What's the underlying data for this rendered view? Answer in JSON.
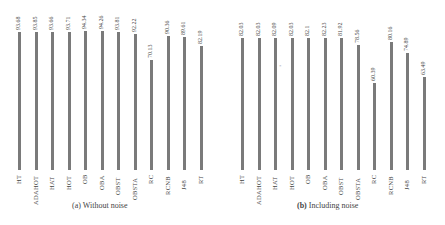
{
  "chart_data": [
    {
      "type": "bar",
      "title": "(a) Without noise",
      "categories": [
        "HT",
        "ADAHOT",
        "HAT",
        "HOT",
        "OB",
        "OBA",
        "OBST",
        "OBSTA",
        "RC",
        "RCNB",
        "J48",
        "RT"
      ],
      "values": [
        93.68,
        93.85,
        93.66,
        93.71,
        94.34,
        94.26,
        93.81,
        92.22,
        70.13,
        90.36,
        89.61,
        82.19
      ],
      "value_labels": [
        "93.68",
        "93.85",
        "93.66",
        "93.71",
        "94.34",
        "94.26",
        "93.81",
        "92.22",
        "70.13",
        "90.36",
        "89.61",
        "82.19"
      ],
      "xlabel": "",
      "ylabel": "",
      "grid": false,
      "legend": false,
      "bar_color": "#7a7a7a"
    },
    {
      "type": "bar",
      "title": "(b) Including noise",
      "categories": [
        "HT",
        "ADAHOT",
        "HAT",
        "HOT",
        "OB",
        "OBA",
        "OBST",
        "OBSTA",
        "RC",
        "RCNB",
        "J48",
        "RT"
      ],
      "values": [
        82.03,
        82.03,
        82.09,
        82.03,
        82.1,
        82.23,
        81.92,
        78.56,
        60.39,
        80.16,
        74.89,
        63.49
      ],
      "value_labels": [
        "82.03",
        "82.03",
        "82.09",
        "82.03",
        "82.1",
        "82.23",
        "81.92",
        "78.56",
        "60.39",
        "80.16",
        "74.89",
        "63.49"
      ],
      "xlabel": "",
      "ylabel": "",
      "grid": false,
      "legend": false,
      "bar_color": "#7a7a7a"
    }
  ],
  "captions": {
    "a_prefix": "(a)",
    "a_text": "Without noise",
    "b_prefix": "(b)",
    "b_text": "Including noise"
  }
}
